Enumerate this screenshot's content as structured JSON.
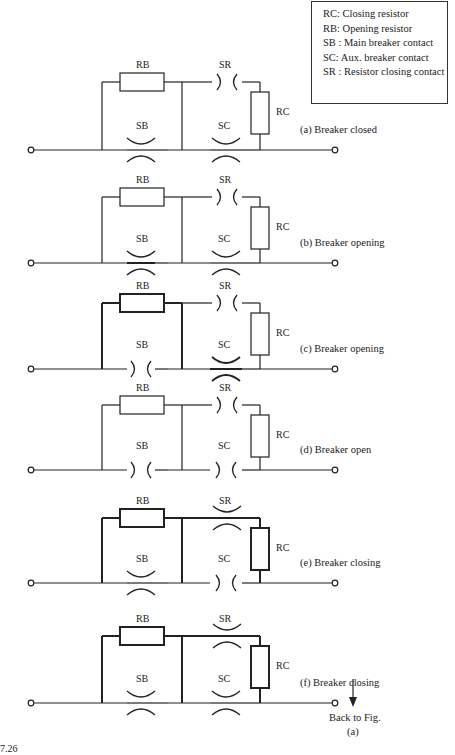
{
  "legend": {
    "items": [
      "RC: Closing resistor",
      "RB: Opening resistor",
      "SB : Main breaker contact",
      "SC: Aux. breaker contact",
      "SR : Resistor closing contact"
    ]
  },
  "labels": {
    "rb": "RB",
    "sr": "SR",
    "sb": "SB",
    "sc": "SC",
    "rc": "RC"
  },
  "panels": [
    {
      "id": "a",
      "caption": "(a) Breaker closed",
      "top": 82,
      "base": 150,
      "sb": "closed",
      "sc": "closed",
      "sr": "open",
      "bold": false
    },
    {
      "id": "b",
      "caption": "(b) Breaker opening",
      "top": 197,
      "base": 263,
      "sb": "closed-bold",
      "sc": "closed",
      "sr": "open",
      "bold": false
    },
    {
      "id": "c",
      "caption": "(c) Breaker opening",
      "top": 303,
      "base": 369,
      "sb": "open",
      "sc": "closed-bold",
      "sr": "open",
      "bold": true
    },
    {
      "id": "d",
      "caption": "(d) Breaker open",
      "top": 405,
      "base": 470,
      "sb": "open",
      "sc": "open",
      "sr": "open",
      "bold": false
    },
    {
      "id": "e",
      "caption": "(e) Breaker closing",
      "top": 518,
      "base": 583,
      "sb": "closed",
      "sc": "open",
      "sr": "closed",
      "bold": true
    },
    {
      "id": "f",
      "caption": "(f) Breaker closing",
      "top": 636,
      "base": 703,
      "sb": "closed",
      "sc": "closed",
      "sr": "closed",
      "bold": true
    }
  ],
  "back_to": {
    "line1": "Back to Fig.",
    "line2": "(a)"
  },
  "figure_number": "7.26"
}
